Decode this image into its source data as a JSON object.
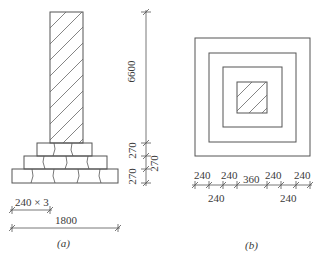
{
  "figure_a": {
    "caption": "(a)",
    "dims": {
      "column_height": "6600",
      "step_1": "270",
      "step_2": "270",
      "step_3": "270",
      "step_width": "240 × 3",
      "base_width": "1800"
    }
  },
  "figure_b": {
    "caption": "(b)",
    "dims_top": [
      "240",
      "240",
      "360",
      "240",
      "240"
    ],
    "dims_bottom": [
      "240",
      "240"
    ]
  },
  "colors": {
    "line": "#555555",
    "text": "#3a3a3a",
    "background": "#ffffff"
  }
}
